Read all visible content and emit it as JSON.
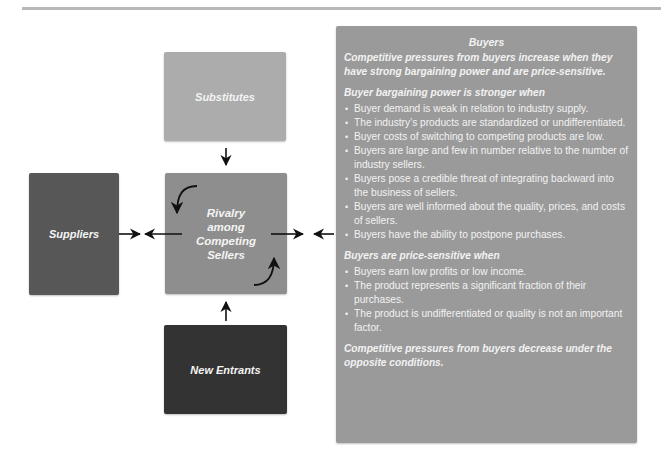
{
  "diagram": {
    "type": "five-forces",
    "boxes": {
      "substitutes": {
        "label": "Substitutes",
        "color": "#acacac"
      },
      "rivalry": {
        "label_lines": [
          "Rivalry",
          "among",
          "Competing",
          "Sellers"
        ],
        "color": "#8e8e8e"
      },
      "suppliers": {
        "label": "Suppliers",
        "color": "#575757"
      },
      "new_entrants": {
        "label": "New Entrants",
        "color": "#333333"
      }
    },
    "buyers_panel": {
      "title": "Buyers",
      "color": "#9a9a9a",
      "intro": "Competitive pressures from buyers increase when they have strong bargaining power and are price-sensitive.",
      "sections": [
        {
          "heading": "Buyer bargaining power is stronger when",
          "items": [
            "Buyer demand is weak in relation to industry supply.",
            "The industry’s products are standardized or undifferentiated.",
            "Buyer costs of switching to competing products are low.",
            "Buyers are large and few in number relative to the number of industry sellers.",
            "Buyers pose a credible threat of integrating backward into the business of sellers.",
            "Buyers are well informed about the quality, prices, and costs of sellers.",
            "Buyers have the ability to postpone purchases."
          ]
        },
        {
          "heading": "Buyers are price-sensitive when",
          "items": [
            "Buyers earn low profits or low income.",
            "The product represents a significant fraction of their purchases.",
            "The product is undifferentiated or quality is not an important factor."
          ]
        }
      ],
      "outro": "Competitive pressures from buyers decrease under the opposite conditions."
    },
    "arrows": [
      {
        "name": "substitutes-to-rivalry",
        "direction": "down"
      },
      {
        "name": "new-entrants-to-rivalry",
        "direction": "up"
      },
      {
        "name": "rivalry-to-suppliers",
        "direction": "left"
      },
      {
        "name": "suppliers-to-rivalry",
        "direction": "right"
      },
      {
        "name": "rivalry-to-buyers",
        "direction": "right"
      },
      {
        "name": "buyers-to-rivalry",
        "direction": "left"
      },
      {
        "name": "rivalry-internal-curve-top",
        "direction": "down"
      },
      {
        "name": "rivalry-internal-curve-bottom",
        "direction": "up"
      }
    ]
  }
}
